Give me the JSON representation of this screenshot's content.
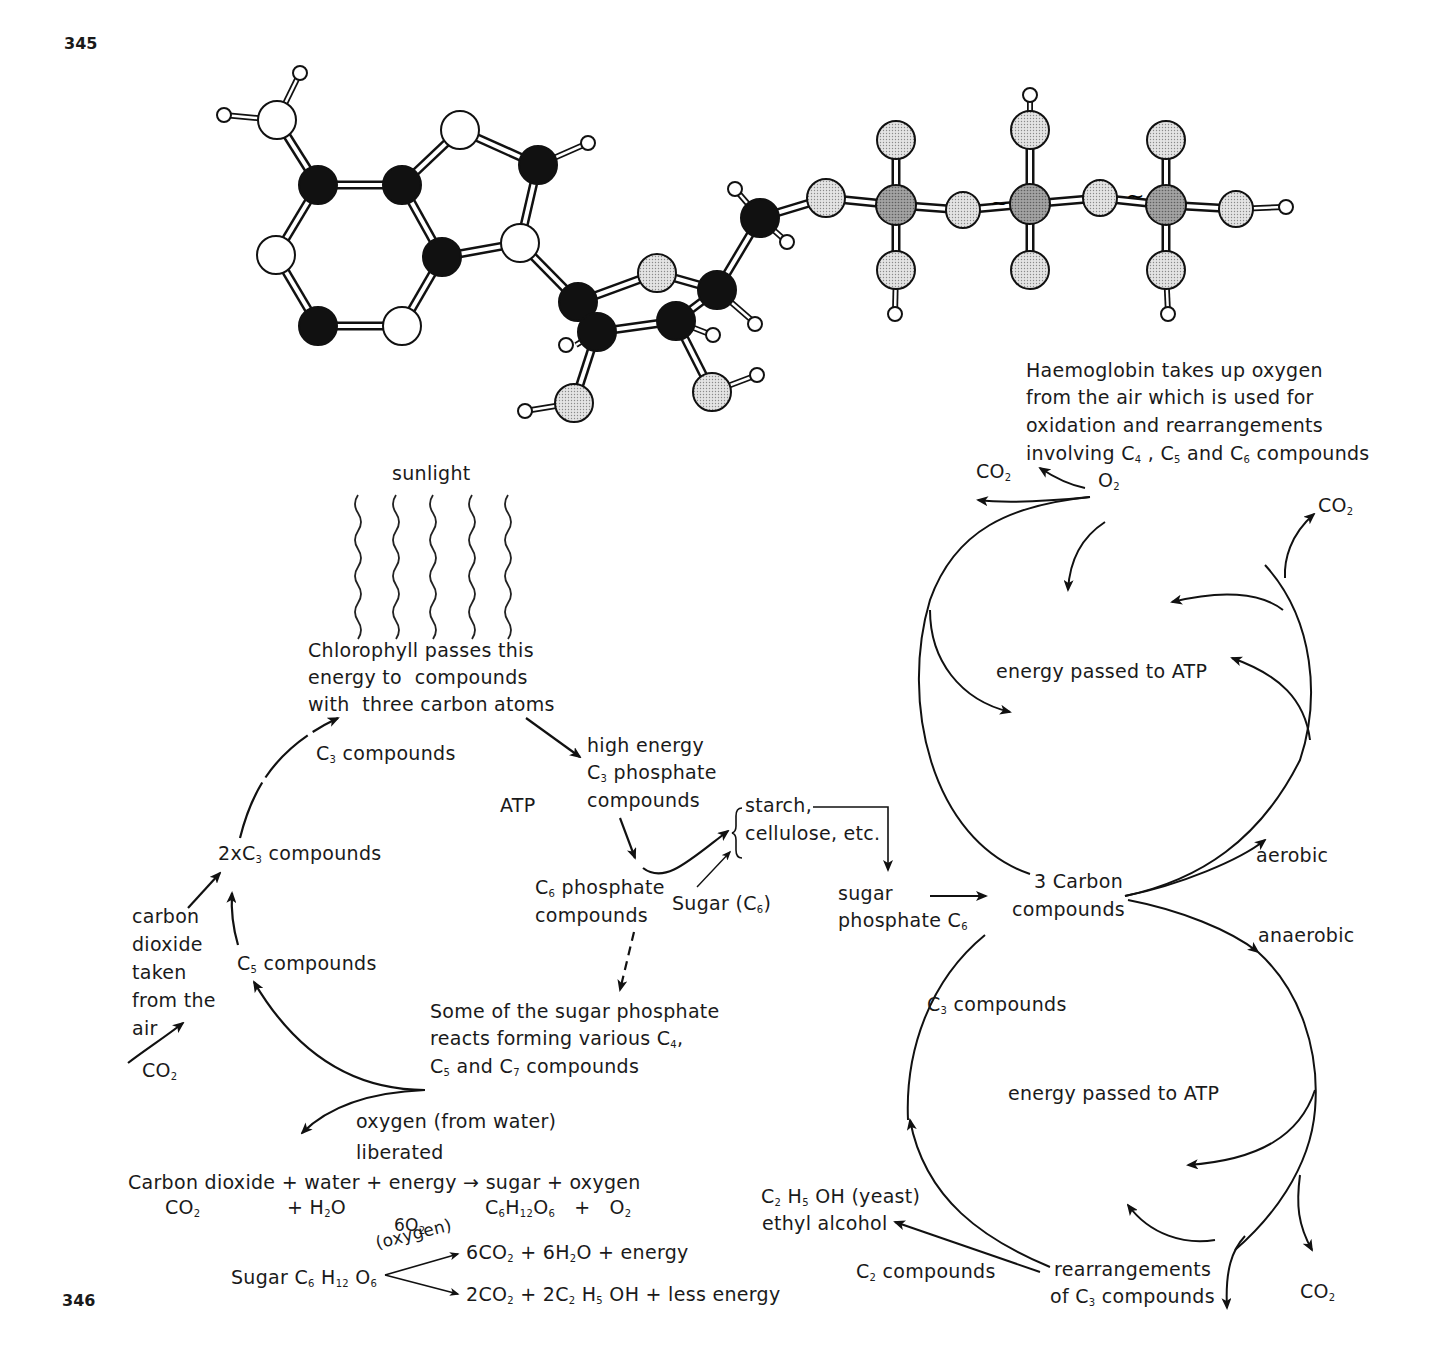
{
  "page_numbers": {
    "top": "345",
    "bottom": "346"
  },
  "figure_345": {
    "subject": "ball-and-stick model of ATP molecule",
    "atom_legend": {
      "carbon": "#111111",
      "nitrogen": "#ffffff",
      "oxygen": "#cfcfcf",
      "phosphorus": "#8f8f8f",
      "hydrogen": "#ffffff"
    },
    "high_energy_bond_symbol": "~"
  },
  "photosynthesis": {
    "sunlight": "sunlight",
    "chlorophyll": [
      "Chlorophyll passes this",
      "energy to  compounds",
      "with  three carbon atoms"
    ],
    "c3_compounds": {
      "pre": "C",
      "sub": "3",
      "post": " compounds"
    },
    "high_energy": {
      "line1": "high energy",
      "line2_pre": "C",
      "line2_sub": "3",
      "line2_post": " phosphate",
      "line3": "compounds"
    },
    "atp": "ATP",
    "starch": [
      "starch,",
      "cellulose, etc."
    ],
    "c6_phosphate": {
      "pre": "C",
      "sub": "6",
      "post": " phosphate",
      "line2": "compounds"
    },
    "sugar_c6": {
      "pre": "Sugar (C",
      "sub": "6",
      "post": ")"
    },
    "sugar_phosphate": {
      "line1": "sugar",
      "line2_pre": "phosphate C",
      "line2_sub": "6"
    },
    "two_c3": {
      "pre": "2xC",
      "sub": "3",
      "post": " compounds"
    },
    "co2_taken": [
      "carbon",
      "dioxide",
      "taken",
      "from the",
      "air"
    ],
    "c5_compounds": {
      "pre": "C",
      "sub": "5",
      "post": " compounds"
    },
    "co2_left": {
      "pre": "CO",
      "sub": "2"
    },
    "some_sugar": {
      "line1": "Some of the sugar phosphate",
      "line2_pre": "reacts forming various C",
      "line2_sub": "4",
      "line2_post": ",",
      "line3_a": "C",
      "line3_a_sub": "5",
      "line3_b": " and C",
      "line3_b_sub": "7",
      "line3_c": " compounds"
    },
    "oxygen_liberated": [
      "oxygen (from water)",
      "liberated"
    ]
  },
  "equations": {
    "word_equation": "Carbon dioxide + water + energy → sugar + oxygen",
    "formula_left": {
      "co2": "CO",
      "co2_sub": "2",
      "h2o_pre": "+ H",
      "h2o_sub": "2",
      "h2o_post": "O"
    },
    "formula_right": {
      "c": "C",
      "c_sub": "6",
      "h": "H",
      "h_sub": "12",
      "o": "O",
      "o_sub": "6",
      "plus": "+",
      "o2": "O",
      "o2_sub": "2"
    },
    "respiration_source": {
      "pre": "Sugar C",
      "s1": "6",
      "mid": " H",
      "s2": "12",
      "end": " O",
      "s3": "6"
    },
    "aerobic_condition": {
      "line1_pre": "6O",
      "line1_sub": "2",
      "line2": "(oxygen)"
    },
    "aerobic_products": {
      "a": "6CO",
      "a_sub": "2",
      "b": " + 6H",
      "b_sub": "2",
      "c": "O + energy"
    },
    "anaerobic_products": {
      "a": "2CO",
      "a_sub": "2",
      "b": " + 2C",
      "b_sub": "2",
      "c": " H",
      "c_sub": "5",
      "d": " OH + less energy"
    }
  },
  "respiration": {
    "haemoglobin": [
      "Haemoglobin takes up oxygen",
      "from the air which is used for",
      "oxidation and rearrangements"
    ],
    "haemoglobin_line4": {
      "pre": "involving C",
      "s1": "4",
      "mid1": " , C",
      "s2": "5",
      "mid2": " and C",
      "s3": "6",
      "post": " compounds"
    },
    "co2_top_left": {
      "pre": "CO",
      "sub": "2"
    },
    "o2": {
      "pre": "O",
      "sub": "2"
    },
    "co2_top_right": {
      "pre": "CO",
      "sub": "2"
    },
    "energy_atp_upper": "energy passed to ATP",
    "aerobic": "aerobic",
    "three_carbon": [
      "3 Carbon",
      "compounds"
    ],
    "anaerobic": "anaerobic",
    "c3_compounds": {
      "pre": "C",
      "sub": "3",
      "post": " compounds"
    },
    "energy_atp_lower": "energy passed to ATP",
    "ethanol": {
      "pre": "C",
      "s1": "2",
      "mid": " H",
      "s2": "5",
      "post": " OH (yeast)",
      "line2": "ethyl alcohol"
    },
    "c2_compounds": {
      "pre": "C",
      "sub": "2",
      "post": " compounds"
    },
    "rearrangements": {
      "line1": "rearrangements",
      "line2_pre": "of C",
      "line2_sub": "3",
      "line2_post": " compounds"
    },
    "co2_bottom": {
      "pre": "CO",
      "sub": "2"
    }
  }
}
